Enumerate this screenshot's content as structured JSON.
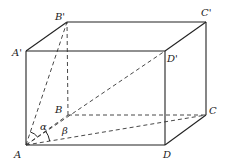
{
  "diagram": {
    "type": "rectangular-prism",
    "vertices": {
      "A": {
        "label": "A",
        "x": 26,
        "y": 145
      },
      "B": {
        "label": "B",
        "x": 68,
        "y": 115
      },
      "C": {
        "label": "C",
        "x": 206,
        "y": 115
      },
      "D": {
        "label": "D",
        "x": 165,
        "y": 145
      },
      "A1": {
        "label": "A'",
        "x": 26,
        "y": 51
      },
      "B1": {
        "label": "B'",
        "x": 67,
        "y": 22
      },
      "C1": {
        "label": "C'",
        "x": 206,
        "y": 22
      },
      "D1": {
        "label": "D'",
        "x": 165,
        "y": 51
      }
    },
    "angles": {
      "alpha": {
        "label": "α"
      },
      "beta": {
        "label": "β"
      }
    },
    "edges_solid": [
      "A-D",
      "D-C",
      "C-C'",
      "D-D'",
      "A-A'",
      "A'-D'",
      "A'-B'",
      "B'-C'",
      "D'-C'"
    ],
    "edges_dashed": [
      "A-B",
      "B-C",
      "B-B'",
      "A-B'",
      "A-C",
      "A-D'"
    ]
  }
}
